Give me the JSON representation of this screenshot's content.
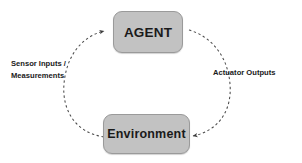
{
  "diagram": {
    "background_color": "#ffffff",
    "node_fill_color": "#c2c2c2",
    "node_border_color": "#9a9a9a",
    "text_color": "#1a1a1a",
    "arc_color": "#4a4a4a",
    "nodes": [
      {
        "id": "agent",
        "label": "AGENT",
        "shape": "rounded-rectangle"
      },
      {
        "id": "environment",
        "label": "Environment",
        "shape": "rounded-rectangle"
      }
    ],
    "edges": [
      {
        "id": "environment-to-agent",
        "from": "environment",
        "to": "agent",
        "style": "dashed-arc",
        "side": "left",
        "label_line1": "Sensor Inputs /",
        "label_line2": "Measurements"
      },
      {
        "id": "agent-to-environment",
        "from": "agent",
        "to": "environment",
        "style": "dashed-arc",
        "side": "right",
        "label_line1": "Actuator  Outputs",
        "label_line2": ""
      }
    ]
  }
}
